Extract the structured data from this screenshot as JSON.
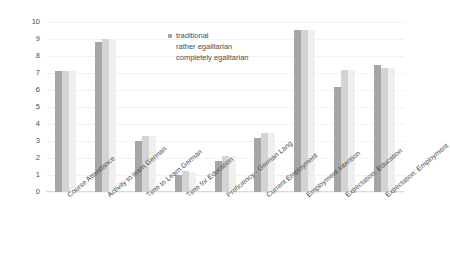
{
  "chart_data": {
    "type": "bar",
    "title": "",
    "subtitle": "",
    "xlabel": "",
    "ylabel": "",
    "ylim": [
      0,
      10
    ],
    "yticks": [
      "0",
      "1",
      "2",
      "3",
      "4",
      "5",
      "6",
      "7",
      "8",
      "9",
      "10"
    ],
    "grid": false,
    "legend_position": "top-center",
    "categories": [
      "Course Attendance",
      "Activity to learn German",
      "Time to Learn German",
      "Time for Education",
      "Proficiency - German Lang",
      "Current Employment",
      "Employment Intention",
      "Expectation: Education",
      "Expectation: Employment"
    ],
    "series": [
      {
        "name": "traditional",
        "color": "#a6a6a6",
        "values": [
          7.1,
          8.8,
          3.0,
          1.0,
          1.85,
          3.2,
          9.55,
          6.2,
          7.5
        ]
      },
      {
        "name": "rather egalitarian",
        "color": "#d4d4d4",
        "values": [
          7.1,
          9.0,
          3.3,
          1.25,
          2.1,
          3.5,
          9.55,
          7.2,
          7.3
        ]
      },
      {
        "name": "completely egalitarian",
        "color": "#efefef",
        "values": [
          7.1,
          9.0,
          3.3,
          1.2,
          2.1,
          3.5,
          9.55,
          7.2,
          7.3
        ]
      }
    ]
  }
}
